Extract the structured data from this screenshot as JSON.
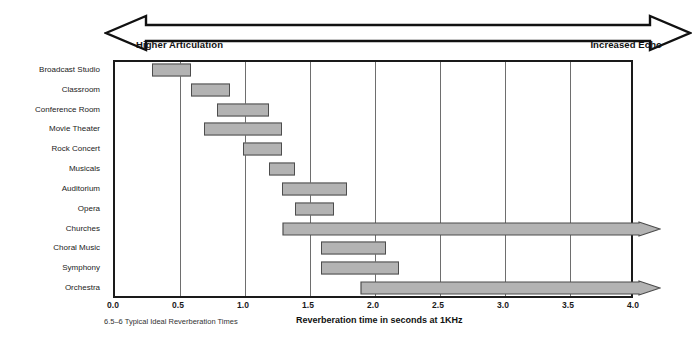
{
  "figure": {
    "caption": "6.5–6 Typical Ideal Reverberation Times",
    "direction_left_label": "Higher Articulation",
    "direction_right_label": "Increased Echo"
  },
  "chart_data": {
    "type": "bar",
    "orientation": "horizontal",
    "title": "",
    "subtitle": "",
    "xlabel": "Reverberation time in seconds at 1KHz",
    "ylabel": "",
    "xlim": [
      0.0,
      4.0
    ],
    "xticks": [
      "0.0",
      "0.5",
      "1.0",
      "1.5",
      "2.0",
      "2.5",
      "3.0",
      "3.5",
      "4.0"
    ],
    "xtick_values": [
      0.0,
      0.5,
      1.0,
      1.5,
      2.0,
      2.5,
      3.0,
      3.5,
      4.0
    ],
    "grid": true,
    "legend": "none",
    "bar_color": "#b3b3b3",
    "bar_edge_color": "#4d4d4d",
    "categories": [
      "Broadcast Studio",
      "Classroom",
      "Conference Room",
      "Movie Theater",
      "Rock Concert",
      "Musicals",
      "Auditorium",
      "Opera",
      "Churches",
      "Choral Music",
      "Symphony",
      "Orchestra"
    ],
    "ranges": [
      {
        "label": "Broadcast Studio",
        "start": 0.3,
        "end": 0.6,
        "open_ended": false
      },
      {
        "label": "Classroom",
        "start": 0.6,
        "end": 0.9,
        "open_ended": false
      },
      {
        "label": "Conference Room",
        "start": 0.8,
        "end": 1.2,
        "open_ended": false
      },
      {
        "label": "Movie Theater",
        "start": 0.7,
        "end": 1.3,
        "open_ended": false
      },
      {
        "label": "Rock Concert",
        "start": 1.0,
        "end": 1.3,
        "open_ended": false
      },
      {
        "label": "Musicals",
        "start": 1.2,
        "end": 1.4,
        "open_ended": false
      },
      {
        "label": "Auditorium",
        "start": 1.3,
        "end": 1.8,
        "open_ended": false
      },
      {
        "label": "Opera",
        "start": 1.4,
        "end": 1.7,
        "open_ended": false
      },
      {
        "label": "Churches",
        "start": 1.3,
        "end": 4.0,
        "open_ended": true
      },
      {
        "label": "Choral Music",
        "start": 1.6,
        "end": 2.1,
        "open_ended": false
      },
      {
        "label": "Symphony",
        "start": 1.6,
        "end": 2.2,
        "open_ended": false
      },
      {
        "label": "Orchestra",
        "start": 1.9,
        "end": 4.0,
        "open_ended": true
      }
    ]
  }
}
